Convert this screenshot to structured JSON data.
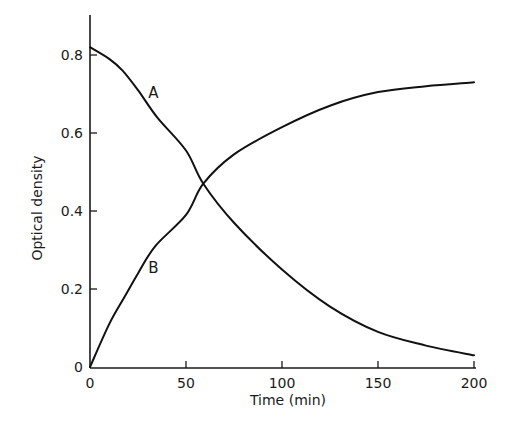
{
  "chart_data": {
    "type": "line",
    "title": "",
    "xlabel": "Time (min)",
    "ylabel": "Optical density",
    "xlim": [
      0,
      200
    ],
    "ylim": [
      0,
      0.9
    ],
    "xticks": [
      0,
      50,
      100,
      150,
      200
    ],
    "xtick_labels": [
      "0",
      "50",
      "100",
      "150",
      "200"
    ],
    "yticks": [
      0,
      0.2,
      0.4,
      0.6,
      0.8
    ],
    "ytick_labels": [
      "0",
      "0.2",
      "0.4",
      "0.6",
      "0.8"
    ],
    "grid": false,
    "legend": "none (curves labelled inline)",
    "series": [
      {
        "name": "A",
        "label_position": {
          "x": 33,
          "y": 0.69
        },
        "x": [
          0,
          10,
          17,
          25,
          35,
          50,
          59,
          75,
          100,
          125,
          150,
          175,
          200
        ],
        "y": [
          0.82,
          0.79,
          0.76,
          0.71,
          0.64,
          0.555,
          0.47,
          0.37,
          0.25,
          0.155,
          0.09,
          0.055,
          0.03
        ]
      },
      {
        "name": "B",
        "label_position": {
          "x": 33,
          "y": 0.24
        },
        "x": [
          0,
          10,
          18,
          25,
          34,
          50,
          59,
          75,
          100,
          125,
          150,
          175,
          200
        ],
        "y": [
          0.0,
          0.11,
          0.18,
          0.24,
          0.31,
          0.39,
          0.47,
          0.545,
          0.615,
          0.67,
          0.705,
          0.72,
          0.73
        ]
      }
    ]
  }
}
